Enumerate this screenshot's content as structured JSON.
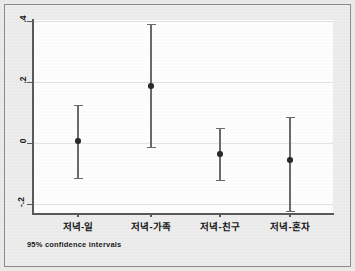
{
  "chart_data": {
    "type": "scatter",
    "title": "",
    "subtitle": "",
    "xlabel": "",
    "ylabel": "",
    "caption": "95% confidence intervals",
    "grid": true,
    "legend": "none",
    "ylim": [
      -0.27,
      0.46
    ],
    "yticks": [
      0.4,
      0.2,
      0.0,
      -0.2
    ],
    "ytick_labels": [
      ".4",
      ".2",
      "0",
      "-.2"
    ],
    "categories": [
      "저녁-일",
      "저녁-가족",
      "저녁-친구",
      "저녁-혼자"
    ],
    "series": [
      {
        "name": "mean with 95% CI",
        "values": [
          0.006,
          0.187,
          -0.036,
          -0.056
        ],
        "ci_low": [
          -0.115,
          -0.013,
          -0.121,
          -0.223
        ],
        "ci_high": [
          0.125,
          0.39,
          0.049,
          0.085
        ]
      }
    ],
    "point_color": "#2a2a2a",
    "line_color": "#6b6b6b",
    "grid_color": "#e4e4e4",
    "panel_color": "#ffffff",
    "figure_color": "#eeeeee"
  }
}
